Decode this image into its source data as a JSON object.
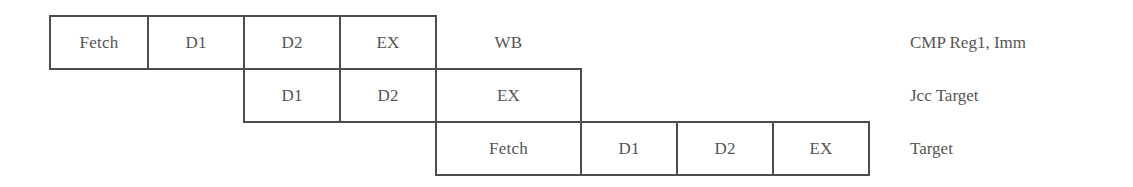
{
  "diagram": {
    "title": "",
    "type": "pipeline-timing",
    "rows": [
      {
        "label": "CMP Reg1, Imm",
        "stages": [
          "Fetch",
          "D1",
          "D2",
          "EX",
          "WB"
        ],
        "start_slot": 0
      },
      {
        "label": "Jcc Target",
        "stages": [
          "D1",
          "D2",
          "EX"
        ],
        "start_slot": 2
      },
      {
        "label": "Target",
        "stages": [
          "Fetch",
          "D1",
          "D2",
          "EX"
        ],
        "start_slot": 4
      }
    ],
    "colors": {
      "line": "#4d4d4d",
      "text": "#555555",
      "background": "#ffffff"
    }
  }
}
